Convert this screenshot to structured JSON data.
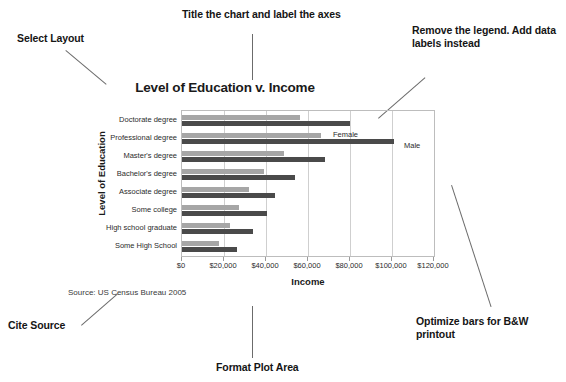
{
  "annotations": [
    {
      "id": "select-layout",
      "text": "Select Layout"
    },
    {
      "id": "title-axes",
      "text": "Title the chart and label the axes"
    },
    {
      "id": "remove-legend",
      "text": "Remove the legend. Add data labels instead"
    },
    {
      "id": "cite-source",
      "text": "Cite Source"
    },
    {
      "id": "format-plot",
      "text": "Format Plot Area"
    },
    {
      "id": "optimize-bw",
      "text": "Optimize bars for B&W printout"
    }
  ],
  "source_note": "Source: US Census Bureau 2005",
  "colors": {
    "female_bar": "#a6a6a6",
    "male_bar": "#4a4a4a",
    "gridline": "#cfcfcf",
    "plot_border": "#bdbdbd",
    "leader_line": "#6b6b6b",
    "text": "#1a1a1a"
  },
  "chart_data": {
    "type": "bar",
    "orientation": "horizontal",
    "title": "Level of Education v. Income",
    "subtitle": "",
    "xlabel": "Income",
    "ylabel": "Level of Education",
    "xlim": [
      0,
      120000
    ],
    "xticks": [
      0,
      20000,
      40000,
      60000,
      80000,
      100000,
      120000
    ],
    "xtick_labels": [
      "$0",
      "$20,000",
      "$40,000",
      "$60,000",
      "$80,000",
      "$100,000",
      "$120,000"
    ],
    "grid": true,
    "grid_axis": "x",
    "legend": true,
    "legend_position": "inside-plot",
    "categories": [
      "Doctorate degree",
      "Professional degree",
      "Master's degree",
      "Bachelor's degree",
      "Associate degree",
      "Some college",
      "High school graduate",
      "Some High School"
    ],
    "series": [
      {
        "name": "Female",
        "color": "#a6a6a6",
        "values": [
          56000,
          66000,
          48500,
          39000,
          32000,
          27000,
          23000,
          17500
        ]
      },
      {
        "name": "Male",
        "color": "#4a4a4a",
        "values": [
          80000,
          101000,
          68000,
          54000,
          44500,
          40500,
          34000,
          26000
        ]
      }
    ],
    "annotations": [
      "Select Layout",
      "Title the chart and label the axes",
      "Remove the legend. Add data labels instead",
      "Cite Source",
      "Format Plot Area",
      "Optimize bars for B&W printout"
    ]
  }
}
